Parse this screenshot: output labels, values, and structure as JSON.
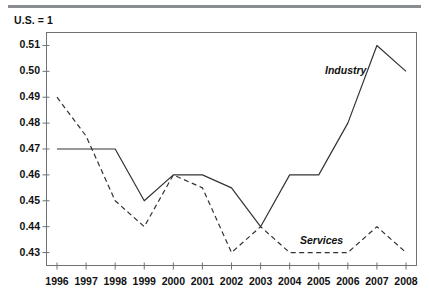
{
  "figure": {
    "units_caption": "U.S. = 1",
    "top_rule_color": "#8a8d91"
  },
  "chart_data": {
    "type": "line",
    "title": "",
    "subtitle": "U.S. = 1",
    "xlabel": "",
    "ylabel": "",
    "x": [
      1996,
      1997,
      1998,
      1999,
      2000,
      2001,
      2002,
      2003,
      2004,
      2005,
      2006,
      2007,
      2008
    ],
    "categories": [
      "1996",
      "1997",
      "1998",
      "1999",
      "2000",
      "2001",
      "2002",
      "2003",
      "2004",
      "2005",
      "2006",
      "2007",
      "2008"
    ],
    "xlim": [
      1996,
      2008
    ],
    "ylim": [
      0.425,
      0.515
    ],
    "yticks": [
      0.43,
      0.44,
      0.45,
      0.46,
      0.47,
      0.48,
      0.49,
      0.5,
      0.51
    ],
    "ytick_labels": [
      "0.43",
      "0.44",
      "0.45",
      "0.46",
      "0.47",
      "0.48",
      "0.49",
      "0.50",
      "0.51"
    ],
    "grid": false,
    "legend": "inline-annotations",
    "series": [
      {
        "name": "Industry",
        "style": "solid",
        "color": "#333333",
        "label_position": {
          "x": 325,
          "y": 64
        },
        "values": [
          0.47,
          0.47,
          0.47,
          0.45,
          0.46,
          0.46,
          0.455,
          0.44,
          0.46,
          0.46,
          0.48,
          0.51,
          0.5
        ]
      },
      {
        "name": "Services",
        "style": "dashed",
        "color": "#333333",
        "label_position": {
          "x": 300,
          "y": 234
        },
        "values": [
          0.49,
          0.475,
          0.45,
          0.44,
          0.46,
          0.455,
          0.43,
          0.44,
          0.43,
          0.43,
          0.43,
          0.44,
          0.43
        ]
      }
    ],
    "annotations": [
      {
        "text": "Industry",
        "kind": "series-label"
      },
      {
        "text": "Services",
        "kind": "series-label"
      }
    ]
  }
}
